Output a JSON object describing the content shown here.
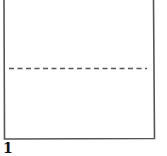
{
  "diagram": {
    "type": "folding-instruction-step",
    "step_number": "1",
    "paper": {
      "shape": "rectangle",
      "top_edge_visible": false,
      "stroke_color": "#555555",
      "fill_color": "#ffffff"
    },
    "fold_line": {
      "style": "dashed",
      "orientation": "horizontal",
      "position": "middle",
      "color": "#555555"
    }
  }
}
